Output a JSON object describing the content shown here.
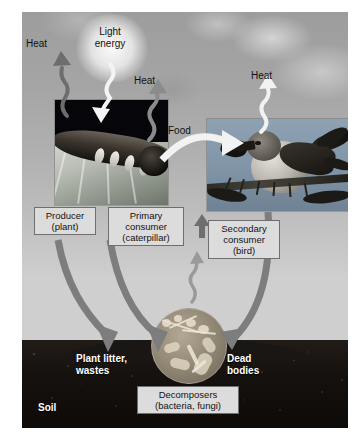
{
  "figure": {
    "credit": "© Dr. Morley Read/Shutterstock.com / Robert McGouey/Getty Images"
  },
  "energy_labels": {
    "light_energy": "Light\nenergy",
    "heat_producer": "Heat",
    "heat_primary": "Heat",
    "heat_secondary": "Heat",
    "food": "Food"
  },
  "trophic_labels": {
    "producer": "Producer\n(plant)",
    "primary_consumer": "Primary\nconsumer\n(caterpillar)",
    "secondary_consumer": "Secondary\nconsumer\n(bird)",
    "decomposers": "Decomposers\n(bacteria, fungi)"
  },
  "soil_labels": {
    "plant_litter": "Plant litter,\nwastes",
    "dead_bodies": "Dead\nbodies",
    "soil": "Soil"
  },
  "colors": {
    "label_fill": "#dcdcdc",
    "label_border": "#6f6f6f",
    "arrow_gray": "#8b8b8b",
    "arrow_dark": "#6e6e6e",
    "arrow_white": "#f2f2f2",
    "soil": "#15110e",
    "sky": "#b0b0b0"
  },
  "icons": {
    "wavy_up": "heat-wavy-arrow-icon",
    "wavy_down": "light-wavy-arrow-icon",
    "curved": "flow-curved-arrow-icon"
  }
}
